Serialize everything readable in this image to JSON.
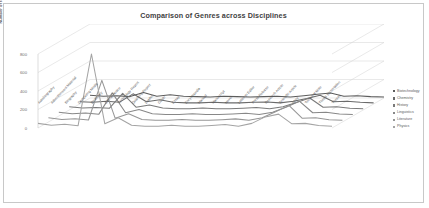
{
  "chart_data": {
    "type": "line",
    "title": "Comparison of Genres across Disciplines",
    "xlabel": "",
    "ylabel": "Number of texts",
    "ylim": [
      0,
      800
    ],
    "yticks": [
      0,
      200,
      400,
      600,
      800
    ],
    "grid": true,
    "legend_position": "right",
    "three_d": true,
    "categories": [
      "Autobiography",
      "Advertisement Material",
      "Biography",
      "Computing Media",
      "Dictionary",
      "Official Notice",
      "Technology Report",
      "Quarterly Report",
      "Leaflet",
      "Guide",
      "Essay",
      "Encyclopedia",
      "Manual",
      "Manuscript",
      "Novel",
      "Letter to Editor",
      "Press Release",
      "Research Article",
      "Scientific Article",
      "Story",
      "Technical Note",
      "Thesis Dissertation",
      "Theses"
    ],
    "series": [
      {
        "name": "Biotechnology",
        "color": "#5c5c5c",
        "values": [
          30,
          20,
          25,
          15,
          60,
          20,
          35,
          20,
          15,
          10,
          20,
          15,
          10,
          15,
          20,
          10,
          25,
          40,
          55,
          20,
          25,
          15,
          10
        ]
      },
      {
        "name": "Chemistry",
        "color": "#6b6b6b",
        "values": [
          25,
          18,
          30,
          20,
          110,
          25,
          45,
          18,
          12,
          12,
          18,
          12,
          12,
          18,
          22,
          12,
          30,
          60,
          95,
          25,
          30,
          18,
          12
        ]
      },
      {
        "name": "History",
        "color": "#7a7a7a",
        "values": [
          35,
          22,
          28,
          18,
          180,
          30,
          55,
          22,
          14,
          14,
          22,
          14,
          14,
          20,
          26,
          14,
          35,
          80,
          130,
          30,
          35,
          20,
          14
        ]
      },
      {
        "name": "Linguistics",
        "color": "#888888",
        "values": [
          40,
          25,
          32,
          20,
          250,
          35,
          70,
          25,
          16,
          16,
          25,
          16,
          16,
          22,
          30,
          16,
          40,
          95,
          160,
          35,
          40,
          22,
          16
        ]
      },
      {
        "name": "Literature",
        "color": "#969696",
        "values": [
          45,
          28,
          36,
          22,
          450,
          40,
          90,
          28,
          18,
          18,
          28,
          18,
          18,
          25,
          34,
          18,
          45,
          110,
          180,
          40,
          45,
          25,
          18
        ]
      },
      {
        "name": "Physics",
        "color": "#a4a4a4",
        "values": [
          50,
          30,
          40,
          25,
          800,
          45,
          110,
          30,
          20,
          20,
          30,
          20,
          20,
          28,
          38,
          20,
          50,
          120,
          150,
          45,
          50,
          28,
          20
        ]
      }
    ]
  },
  "chart": {
    "title": "Comparison of Genres across Disciplines"
  }
}
